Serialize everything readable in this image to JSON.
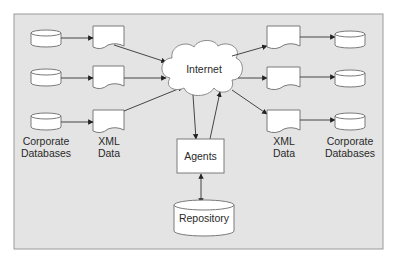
{
  "diagram": {
    "frame": {
      "x": 14,
      "y": 14,
      "w": 369,
      "h": 235,
      "fill": "#e4e4e4",
      "stroke": "#9a9a9a"
    },
    "colors": {
      "shape_fill": "#ffffff",
      "shape_stroke": "#7a7a7a",
      "arrow": "#333333",
      "text": "#2a2a2a"
    },
    "internet": {
      "label": "Internet",
      "cx": 204,
      "cy": 69
    },
    "agents": {
      "label": "Agents",
      "x": 177,
      "y": 139,
      "w": 47,
      "h": 34
    },
    "repository": {
      "label": "Repository",
      "x": 174,
      "y": 200,
      "w": 60,
      "h": 36
    },
    "left_group": {
      "databases": [
        {
          "x": 31,
          "y": 30,
          "w": 30,
          "h": 17
        },
        {
          "x": 31,
          "y": 69,
          "w": 30,
          "h": 17
        },
        {
          "x": 31,
          "y": 113,
          "w": 30,
          "h": 17
        }
      ],
      "xml_docs": [
        {
          "x": 93,
          "y": 26,
          "w": 31,
          "h": 24
        },
        {
          "x": 93,
          "y": 66,
          "w": 31,
          "h": 22
        },
        {
          "x": 93,
          "y": 110,
          "w": 31,
          "h": 22
        }
      ],
      "db_label_line1": "Corporate",
      "db_label_line2": "Databases",
      "xml_label_line1": "XML",
      "xml_label_line2": "Data"
    },
    "right_group": {
      "xml_docs": [
        {
          "x": 267,
          "y": 26,
          "w": 33,
          "h": 22
        },
        {
          "x": 267,
          "y": 67,
          "w": 33,
          "h": 22
        },
        {
          "x": 267,
          "y": 110,
          "w": 33,
          "h": 22
        }
      ],
      "databases": [
        {
          "x": 335,
          "y": 31,
          "w": 30,
          "h": 17
        },
        {
          "x": 335,
          "y": 70,
          "w": 30,
          "h": 17
        },
        {
          "x": 335,
          "y": 113,
          "w": 30,
          "h": 17
        }
      ],
      "xml_label_line1": "XML",
      "xml_label_line2": "Data",
      "db_label_line1": "Corporate",
      "db_label_line2": "Databases"
    }
  }
}
